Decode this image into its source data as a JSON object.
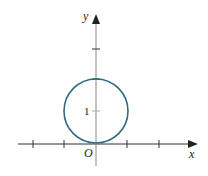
{
  "figure": {
    "x_axis_label": "x",
    "y_axis_label": "y",
    "origin_label": "O",
    "y_tick_label": "1",
    "circle_color": "#2e6b80",
    "axis_color": "#333333",
    "caption": ""
  }
}
